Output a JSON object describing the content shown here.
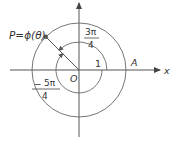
{
  "diagram": {
    "type": "polar-angle-diagram",
    "colors": {
      "line": "#555555",
      "text": "#333333",
      "background": "#ffffff"
    },
    "labels": {
      "point": "P=ϕ(θ)",
      "origin": "O",
      "x_axis": "x",
      "point_a": "A",
      "radius": "1",
      "angle_pos_num": "3π",
      "angle_pos_den": "4",
      "angle_neg_sign": "−",
      "angle_neg_num": "5π",
      "angle_neg_den": "4"
    },
    "geometry": {
      "origin": [
        79,
        70
      ],
      "unit_circle_radius": 47,
      "angle_positive": "3π/4",
      "angle_negative": "-5π/4"
    }
  }
}
